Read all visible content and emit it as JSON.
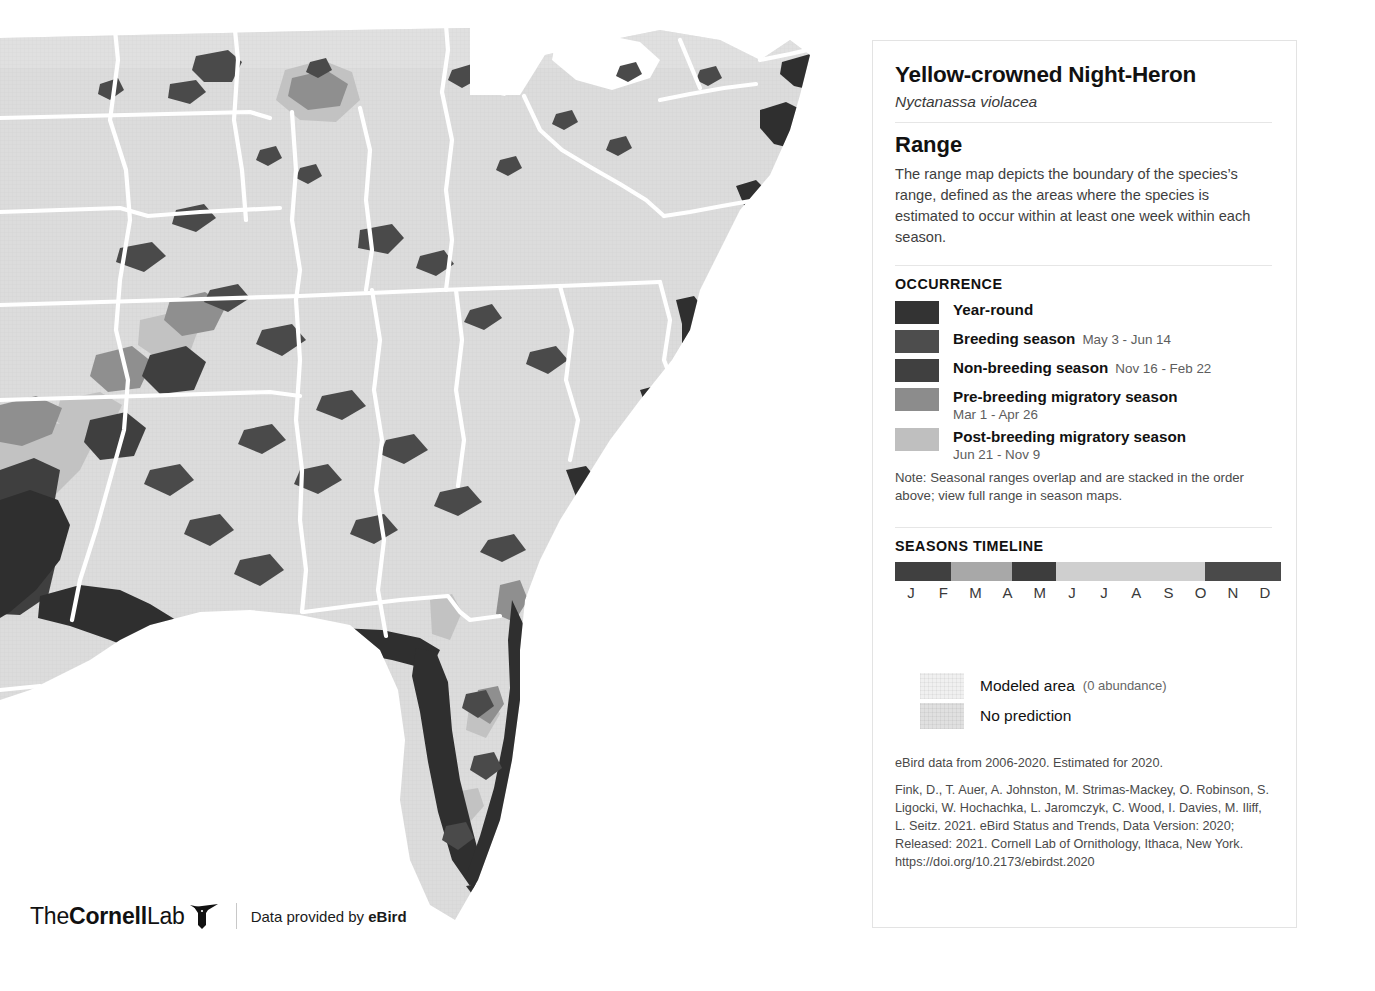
{
  "map": {
    "region_name": "eastern-united-states",
    "base_color": "#dcdcdc",
    "no_prediction_color": "#e2e2e2",
    "boundary_color": "#ffffff",
    "ocean_color": "#ffffff",
    "colors": {
      "year_round": "#333333",
      "breeding": "#4d4d4d",
      "non_breeding": "#404040",
      "pre_breeding": "#8c8c8c",
      "post_breeding": "#bfbfbf"
    }
  },
  "attribution": {
    "logo_the": "The",
    "logo_cornell": "Cornell",
    "logo_lab": "Lab",
    "bird_icon": "bird-icon",
    "credit_prefix": "Data provided by ",
    "credit_brand": "eBird"
  },
  "panel": {
    "species_common_name": "Yellow-crowned Night-Heron",
    "species_scientific_name": "Nyctanassa violacea",
    "section_title": "Range",
    "description": "The range map depicts the boundary of the species’s range, defined as the areas where the species is estimated to occur within at least one week within each season.",
    "occurrence_label": "OCCURRENCE",
    "occurrence": [
      {
        "name": "Year-round",
        "dates": "",
        "color": "#333333",
        "dates_block": false
      },
      {
        "name": "Breeding season",
        "dates": "May 3 - Jun 14",
        "color": "#4d4d4d",
        "dates_block": false
      },
      {
        "name": "Non-breeding season",
        "dates": "Nov 16 - Feb 22",
        "color": "#404040",
        "dates_block": false
      },
      {
        "name": "Pre-breeding migratory season",
        "dates": "Mar 1 - Apr 26",
        "color": "#8c8c8c",
        "dates_block": true
      },
      {
        "name": "Post-breeding migratory season",
        "dates": "Jun 21 - Nov 9",
        "color": "#bfbfbf",
        "dates_block": true
      }
    ],
    "occurrence_note": "Note: Seasonal ranges overlap and are stacked in the order above; view full range in season maps.",
    "timeline_label": "SEASONS TIMELINE",
    "timeline_months": [
      "J",
      "F",
      "M",
      "A",
      "M",
      "J",
      "J",
      "A",
      "S",
      "O",
      "N",
      "D"
    ],
    "timeline_segments": [
      {
        "season": "non-breeding",
        "color": "#404040",
        "width_pct": 14.6
      },
      {
        "season": "pre-breeding",
        "color": "#a8a8a8",
        "width_pct": 15.6
      },
      {
        "season": "breeding",
        "color": "#3d3d3d",
        "width_pct": 11.5
      },
      {
        "season": "post-breeding",
        "color": "#cfcfcf",
        "width_pct": 38.6
      },
      {
        "season": "non-breeding",
        "color": "#4a4a4a",
        "width_pct": 19.7
      }
    ],
    "modeled_legend": [
      {
        "label": "Modeled area",
        "sub": "(0 abundance)",
        "color": "#f0f0f0"
      },
      {
        "label": "No prediction",
        "sub": "",
        "color": "#e0e0e0"
      }
    ],
    "citation_line1": "eBird data from 2006-2020. Estimated for 2020.",
    "citation_body": "Fink, D., T. Auer, A. Johnston, M. Strimas-Mackey, O. Robinson, S. Ligocki, W. Hochachka, L. Jaromczyk, C. Wood, I. Davies, M. Iliff, L. Seitz. 2021. eBird Status and Trends, Data Version: 2020; Released: 2021. Cornell Lab of Ornithology, Ithaca, New York. https://doi.org/10.2173/ebirdst.2020"
  }
}
